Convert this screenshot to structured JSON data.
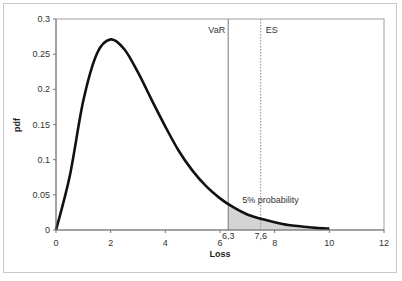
{
  "chart_data": {
    "type": "line",
    "title": "",
    "xlabel": "Loss",
    "ylabel": "pdf",
    "xlim": [
      0,
      12
    ],
    "ylim": [
      0,
      0.3
    ],
    "grid": false,
    "legend": null,
    "x_ticks": [
      "0",
      "2",
      "4",
      "6",
      "8",
      "10",
      "12"
    ],
    "y_ticks": [
      "0",
      "0.05",
      "0.1",
      "0.15",
      "0.2",
      "0.25",
      "0.3"
    ],
    "series": [
      {
        "name": "Loss distribution pdf",
        "x": [
          0,
          0.5,
          1,
          1.5,
          2,
          2.5,
          3,
          3.5,
          4,
          4.5,
          5,
          5.5,
          6,
          6.5,
          7,
          7.5,
          8,
          8.5,
          9,
          9.5,
          10
        ],
        "values": [
          0,
          0.076,
          0.184,
          0.251,
          0.271,
          0.257,
          0.224,
          0.185,
          0.147,
          0.112,
          0.084,
          0.062,
          0.045,
          0.032,
          0.022,
          0.016,
          0.011,
          0.007,
          0.005,
          0.003,
          0.002
        ]
      }
    ],
    "annotations": [
      {
        "type": "vline",
        "x": 6.3,
        "label": "VaR",
        "style": "solid"
      },
      {
        "type": "vline",
        "x": 7.6,
        "label": "ES",
        "style": "dotted"
      },
      {
        "type": "shaded_area",
        "from_x": 6.3,
        "to_x": 10,
        "label": "5% probability"
      },
      {
        "type": "tick_label",
        "x": 6.3,
        "text": "6,3"
      },
      {
        "type": "tick_label",
        "x": 7.6,
        "text": "7,6"
      }
    ]
  },
  "labels": {
    "var": "VaR",
    "es": "ES",
    "tail": "5% probability",
    "var_value": "6,3",
    "es_value": "7,6",
    "xlabel": "Loss",
    "ylabel": "pdf"
  },
  "colors": {
    "curve": "#111111",
    "shade": "#d4d4d4",
    "axis": "#888888",
    "frame": "#c8c8c8"
  }
}
